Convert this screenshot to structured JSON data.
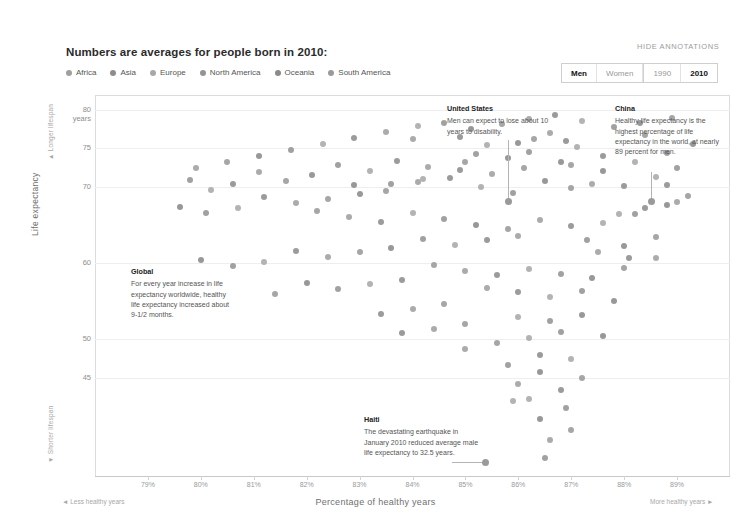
{
  "header": {
    "headline": "Numbers are averages for people born in 2010:",
    "hide_annotations": "HIDE ANNOTATIONS"
  },
  "legend": [
    {
      "label": "Africa",
      "color": "#9f9f9f"
    },
    {
      "label": "Asia",
      "color": "#8d8d8d"
    },
    {
      "label": "Europe",
      "color": "#a8a8a8"
    },
    {
      "label": "North America",
      "color": "#949494"
    },
    {
      "label": "Oceania",
      "color": "#8a8a8a"
    },
    {
      "label": "South America",
      "color": "#9a9a9a"
    }
  ],
  "toggles": {
    "sex": [
      {
        "label": "Men",
        "selected": true
      },
      {
        "label": "Women",
        "selected": false
      }
    ],
    "year": [
      {
        "label": "1990",
        "selected": false
      },
      {
        "label": "2010",
        "selected": true
      }
    ]
  },
  "annotations": [
    {
      "id": "united-states",
      "title": "United States",
      "text": "Men can expect to lose about 10 years to disability."
    },
    {
      "id": "china",
      "title": "China",
      "text": "Healthy life expectancy is the highest percentage of life expectancy in the world, at nearly 89 percent for men."
    },
    {
      "id": "global",
      "title": "Global",
      "text": "For every year increase in life expectancy worldwide, healthy life expectancy increased about 9-1/2 months."
    },
    {
      "id": "haiti",
      "title": "Haiti",
      "text": "The devastating earthquake in January 2010 reduced average male life expectancy to 32.5 years."
    }
  ],
  "chart_data": {
    "type": "scatter",
    "title": "Numbers are averages for people born in 2010:",
    "xlabel": "Percentage of healthy years",
    "ylabel": "Life expectancy",
    "xlim": [
      78,
      90
    ],
    "ylim": [
      32,
      82
    ],
    "grid": true,
    "legend_position": "top-left",
    "axis_end_labels": {
      "x_left": "Less healthy years",
      "x_right": "More healthy years",
      "y_top": "Longer lifespan",
      "y_bottom": "Shorter lifespan"
    },
    "xticks": [
      {
        "value": 79,
        "label": "79%"
      },
      {
        "value": 80,
        "label": "80%"
      },
      {
        "value": 81,
        "label": "81%"
      },
      {
        "value": 82,
        "label": "82%"
      },
      {
        "value": 83,
        "label": "83%"
      },
      {
        "value": 84,
        "label": "84%"
      },
      {
        "value": 85,
        "label": "85%"
      },
      {
        "value": 86,
        "label": "86%"
      },
      {
        "value": 87,
        "label": "87%"
      },
      {
        "value": 88,
        "label": "88%"
      },
      {
        "value": 89,
        "label": "89%"
      }
    ],
    "yticks": [
      {
        "value": 80,
        "label": "80 years"
      },
      {
        "value": 75,
        "label": "75"
      },
      {
        "value": 70,
        "label": "70"
      },
      {
        "value": 60,
        "label": "60"
      },
      {
        "value": 50,
        "label": "50"
      },
      {
        "value": 45,
        "label": "45"
      }
    ],
    "series": [
      {
        "name": "countries",
        "points": [
          [
            84.0,
            76.2
          ],
          [
            84.9,
            76.5
          ],
          [
            85.4,
            75.5
          ],
          [
            85.2,
            74.3
          ],
          [
            86.0,
            75.7
          ],
          [
            86.3,
            76.3
          ],
          [
            86.6,
            77.0
          ],
          [
            86.9,
            76.0
          ],
          [
            87.1,
            75.2
          ],
          [
            86.2,
            74.6
          ],
          [
            85.8,
            73.8
          ],
          [
            85.0,
            73.2
          ],
          [
            84.3,
            72.6
          ],
          [
            83.7,
            73.4
          ],
          [
            83.2,
            72.0
          ],
          [
            82.6,
            72.8
          ],
          [
            82.1,
            71.5
          ],
          [
            81.6,
            70.8
          ],
          [
            81.1,
            71.9
          ],
          [
            80.6,
            70.3
          ],
          [
            80.2,
            69.6
          ],
          [
            79.8,
            70.9
          ],
          [
            82.9,
            70.2
          ],
          [
            83.5,
            69.4
          ],
          [
            84.1,
            70.6
          ],
          [
            84.7,
            71.2
          ],
          [
            85.3,
            70.0
          ],
          [
            85.9,
            69.2
          ],
          [
            86.5,
            70.8
          ],
          [
            87.0,
            69.8
          ],
          [
            87.4,
            70.4
          ],
          [
            88.0,
            70.1
          ],
          [
            88.6,
            71.3
          ],
          [
            89.0,
            72.5
          ],
          [
            86.8,
            73.2
          ],
          [
            86.1,
            72.4
          ],
          [
            85.5,
            71.6
          ],
          [
            84.9,
            72.2
          ],
          [
            84.2,
            71.0
          ],
          [
            83.6,
            70.4
          ],
          [
            83.0,
            69.0
          ],
          [
            82.4,
            68.4
          ],
          [
            81.8,
            67.8
          ],
          [
            81.2,
            68.6
          ],
          [
            80.7,
            67.2
          ],
          [
            80.1,
            66.5
          ],
          [
            79.6,
            67.4
          ],
          [
            82.2,
            66.8
          ],
          [
            82.8,
            66.0
          ],
          [
            83.4,
            65.4
          ],
          [
            84.0,
            66.6
          ],
          [
            84.6,
            65.8
          ],
          [
            85.2,
            65.0
          ],
          [
            85.8,
            64.4
          ],
          [
            86.4,
            65.6
          ],
          [
            87.0,
            64.8
          ],
          [
            87.6,
            65.2
          ],
          [
            88.2,
            66.4
          ],
          [
            88.8,
            67.6
          ],
          [
            89.2,
            68.8
          ],
          [
            86.0,
            63.6
          ],
          [
            85.4,
            63.0
          ],
          [
            84.8,
            62.4
          ],
          [
            84.2,
            63.2
          ],
          [
            83.6,
            62.0
          ],
          [
            83.0,
            61.4
          ],
          [
            82.4,
            60.8
          ],
          [
            81.8,
            61.6
          ],
          [
            81.2,
            60.2
          ],
          [
            80.6,
            59.6
          ],
          [
            80.0,
            60.4
          ],
          [
            84.4,
            59.8
          ],
          [
            85.0,
            59.0
          ],
          [
            85.6,
            58.4
          ],
          [
            86.2,
            59.2
          ],
          [
            86.8,
            58.6
          ],
          [
            87.4,
            58.0
          ],
          [
            88.0,
            59.4
          ],
          [
            88.6,
            60.6
          ],
          [
            83.8,
            57.8
          ],
          [
            83.2,
            57.2
          ],
          [
            82.6,
            56.6
          ],
          [
            82.0,
            57.4
          ],
          [
            81.4,
            56.0
          ],
          [
            85.4,
            56.8
          ],
          [
            86.0,
            56.2
          ],
          [
            86.6,
            55.6
          ],
          [
            87.2,
            56.4
          ],
          [
            87.8,
            55.0
          ],
          [
            84.6,
            54.6
          ],
          [
            84.0,
            54.0
          ],
          [
            83.4,
            53.4
          ],
          [
            86.0,
            53.0
          ],
          [
            86.6,
            52.4
          ],
          [
            87.2,
            53.2
          ],
          [
            85.0,
            52.0
          ],
          [
            84.4,
            51.4
          ],
          [
            83.8,
            50.8
          ],
          [
            86.2,
            50.2
          ],
          [
            86.8,
            51.0
          ],
          [
            87.6,
            50.4
          ],
          [
            85.6,
            49.6
          ],
          [
            85.0,
            48.8
          ],
          [
            86.4,
            48.0
          ],
          [
            87.0,
            47.4
          ],
          [
            85.8,
            46.6
          ],
          [
            86.4,
            45.8
          ],
          [
            87.2,
            45.0
          ],
          [
            86.0,
            44.2
          ],
          [
            86.8,
            43.4
          ],
          [
            86.2,
            42.2
          ],
          [
            86.9,
            41.0
          ],
          [
            86.4,
            39.6
          ],
          [
            87.0,
            38.2
          ],
          [
            86.6,
            36.8
          ],
          [
            88.8,
            70.2
          ],
          [
            84.1,
            78.0
          ],
          [
            84.6,
            78.4
          ],
          [
            85.1,
            77.6
          ],
          [
            85.7,
            78.2
          ],
          [
            86.2,
            78.8
          ],
          [
            86.7,
            79.4
          ],
          [
            87.2,
            78.6
          ],
          [
            87.8,
            77.8
          ],
          [
            88.3,
            78.4
          ],
          [
            88.9,
            79.0
          ],
          [
            83.5,
            77.2
          ],
          [
            82.9,
            76.4
          ],
          [
            82.3,
            75.6
          ],
          [
            81.7,
            74.8
          ],
          [
            81.1,
            74.0
          ],
          [
            80.5,
            73.2
          ],
          [
            79.9,
            72.4
          ],
          [
            87.6,
            74.0
          ],
          [
            88.2,
            73.2
          ],
          [
            88.8,
            74.4
          ],
          [
            89.3,
            75.6
          ],
          [
            88.4,
            76.8
          ],
          [
            89.0,
            68.0
          ],
          [
            88.4,
            67.2
          ],
          [
            87.9,
            66.4
          ],
          [
            87.3,
            63.0
          ],
          [
            88.0,
            62.2
          ],
          [
            88.6,
            63.4
          ],
          [
            87.5,
            61.4
          ],
          [
            88.1,
            60.6
          ],
          [
            85.9,
            42.0
          ],
          [
            86.5,
            34.5
          ],
          [
            87.6,
            72.0
          ],
          [
            87.0,
            72.8
          ]
        ]
      }
    ],
    "highlighted": [
      {
        "id": "united-states",
        "x": 84.9,
        "y": 70.4
      },
      {
        "id": "china",
        "x": 88.9,
        "y": 70.2
      },
      {
        "id": "haiti",
        "x": 86.5,
        "y": 32.5
      }
    ]
  }
}
